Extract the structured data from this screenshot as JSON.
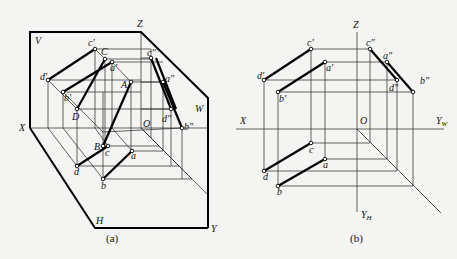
{
  "figure_a": {
    "caption": "(a)",
    "plane_labels": {
      "V": "V",
      "W": "W",
      "H": "H"
    },
    "axis_labels": {
      "X": "X",
      "Y": "Y",
      "Z": "Z",
      "O": "O"
    },
    "space_points": {
      "A": "A",
      "B": "B",
      "C": "C",
      "D": "D"
    },
    "front_view": {
      "a": "a'",
      "b": "b'",
      "c": "c'",
      "d": "d'"
    },
    "side_view": {
      "a": "a\"",
      "b": "b\"",
      "c": "c\"",
      "d": "d\""
    },
    "top_view": {
      "a": "a",
      "b": "b",
      "c": "c",
      "d": "d"
    }
  },
  "figure_b": {
    "caption": "(b)",
    "axis_labels": {
      "X": "X",
      "Z": "Z",
      "O": "O",
      "YW": "Y",
      "YW_sub": "W",
      "YH": "Y",
      "YH_sub": "H"
    },
    "front_view": {
      "a": "a'",
      "b": "b'",
      "c": "c'",
      "d": "d'"
    },
    "side_view": {
      "a": "a\"",
      "b": "b\"",
      "c": "c\"",
      "d": "d\""
    },
    "top_view": {
      "a": "a",
      "b": "b",
      "c": "c",
      "d": "d"
    }
  }
}
